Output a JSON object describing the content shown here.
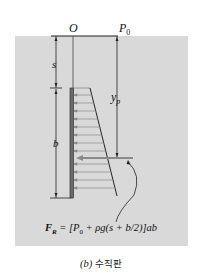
{
  "figure": {
    "labels": {
      "origin": "O",
      "surface_pressure": "P",
      "surface_pressure_sub": "0",
      "depth_to_plate": "s",
      "plate_height": "b",
      "center_of_pressure": "y",
      "center_of_pressure_sub": "p"
    },
    "formula": {
      "lhs": "F",
      "lhs_sub": "R",
      "rhs": " = [P",
      "rhs_sub": "0",
      "rhs_rest": " + ρg(s + b/2)]ab"
    },
    "caption": {
      "part": "(b)",
      "title": "수직판"
    },
    "colors": {
      "panel": "#d9d9d9",
      "line": "#222222",
      "pressure_line": "#8a8a8a",
      "plate": "#6b6b6b"
    }
  }
}
